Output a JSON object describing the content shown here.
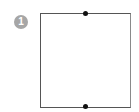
{
  "diagram": {
    "badge": {
      "label": "1",
      "color": "#a6a6a6"
    },
    "shape": {
      "type": "square",
      "stroke": "#555555"
    },
    "points": [
      {
        "name": "top-midpoint"
      },
      {
        "name": "bottom-midpoint"
      }
    ]
  }
}
